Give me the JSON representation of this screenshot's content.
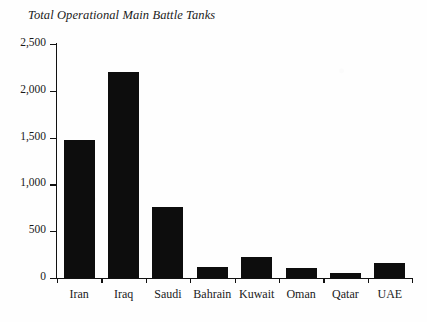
{
  "chart_data": {
    "type": "bar",
    "title": "Total Operational Main Battle Tanks",
    "xlabel": "",
    "ylabel": "",
    "categories": [
      "Iran",
      "Iraq",
      "Saudi",
      "Bahrain",
      "Kuwait",
      "Oman",
      "Qatar",
      "UAE"
    ],
    "values": [
      1470,
      2200,
      760,
      120,
      220,
      110,
      55,
      165
    ],
    "ylim": [
      0,
      2500
    ],
    "ytick_values": [
      0,
      500,
      1000,
      1500,
      2000,
      2500
    ],
    "ytick_labels": [
      "0",
      "500",
      "1,000",
      "1,500",
      "2,000",
      "2,500"
    ],
    "grid": false,
    "legend": null,
    "bar_color": "#0d0d0d",
    "background_color": "#fefefe",
    "axis_color": "#111111"
  }
}
